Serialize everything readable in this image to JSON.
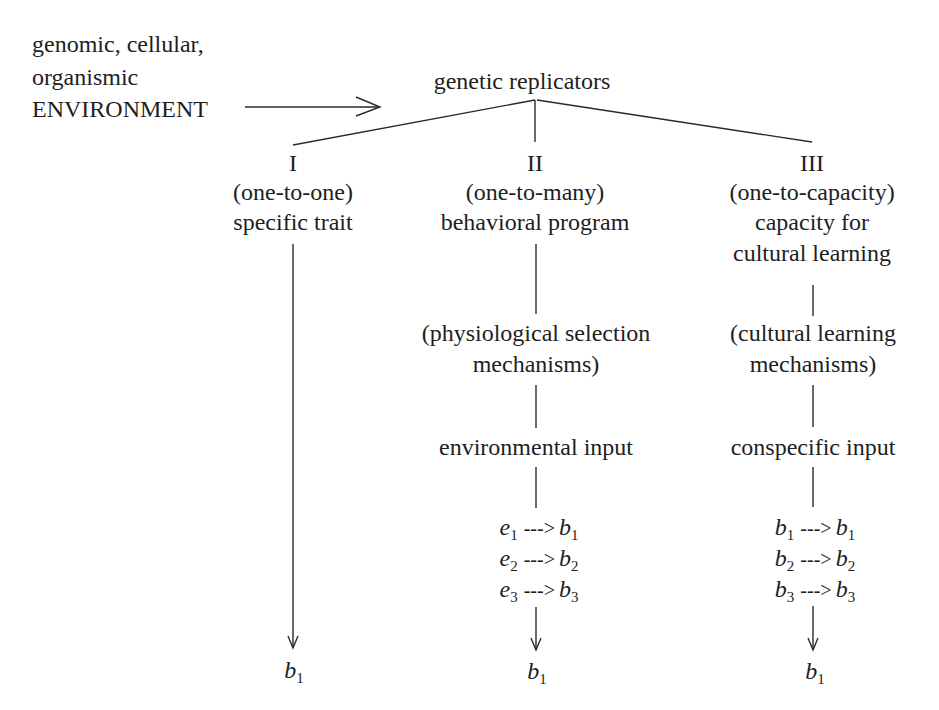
{
  "environment": {
    "lines": [
      "genomic, cellular,",
      "organismic",
      "ENVIRONMENT"
    ]
  },
  "root": {
    "label": "genetic replicators"
  },
  "columns": [
    {
      "numeral": "I",
      "relation": "(one-to-one)",
      "title": [
        "specific trait"
      ],
      "outcome": {
        "var": "b",
        "sub": "1"
      }
    },
    {
      "numeral": "II",
      "relation": "(one-to-many)",
      "title": [
        "behavioral program"
      ],
      "mechanism": [
        "(physiological selection",
        "mechanisms)"
      ],
      "input": "environmental input",
      "mappings": [
        {
          "from": "e",
          "from_sub": "1",
          "arrow": "--->",
          "to": "b",
          "to_sub": "1"
        },
        {
          "from": "e",
          "from_sub": "2",
          "arrow": "--->",
          "to": "b",
          "to_sub": "2"
        },
        {
          "from": "e",
          "from_sub": "3",
          "arrow": "--->",
          "to": "b",
          "to_sub": "3"
        }
      ],
      "outcome": {
        "var": "b",
        "sub": "1"
      }
    },
    {
      "numeral": "III",
      "relation": "(one-to-capacity)",
      "title": [
        "capacity for",
        "cultural learning"
      ],
      "mechanism": [
        "(cultural learning",
        "mechanisms)"
      ],
      "input": "conspecific input",
      "mappings": [
        {
          "from": "b",
          "from_sub": "1",
          "arrow": "--->",
          "to": "b",
          "to_sub": "1"
        },
        {
          "from": "b",
          "from_sub": "2",
          "arrow": "--->",
          "to": "b",
          "to_sub": "2"
        },
        {
          "from": "b",
          "from_sub": "3",
          "arrow": "--->",
          "to": "b",
          "to_sub": "3"
        }
      ],
      "outcome": {
        "var": "b",
        "sub": "1"
      }
    }
  ],
  "colors": {
    "ink": "#1e1e1e",
    "background": "#ffffff"
  }
}
